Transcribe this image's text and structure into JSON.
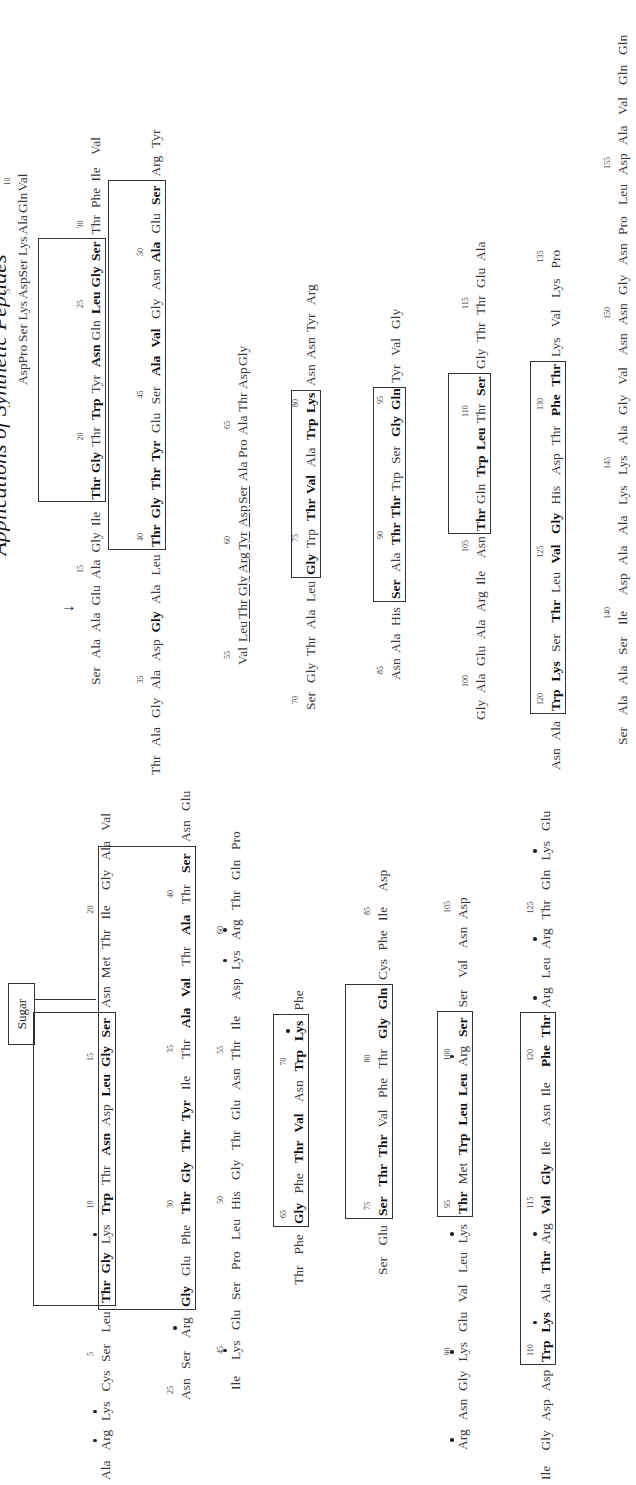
{
  "header": {
    "title": "Applications of Synthetic Peptides"
  },
  "figure": {
    "sugar_label": "Sugar",
    "cleavage_arrow": "↓",
    "sequence_a": {
      "rows": [
        {
          "residues": [
            "Asp",
            "Pro",
            "Ser",
            "Lys",
            "Asp",
            "Ser",
            "Lys",
            "Ala",
            "Gln",
            "Val"
          ],
          "numbers": {
            "4": "5",
            "9": "10"
          }
        },
        {
          "residues": [
            "Ser",
            "Ala",
            "Ala",
            "Glu",
            "Ala",
            "Gly",
            "Ile",
            "Thr",
            "Gly",
            "Thr",
            "Trp",
            "Tyr",
            "Asn",
            "Gln",
            "Leu",
            "Gly",
            "Ser",
            "Thr",
            "Phe",
            "Ile",
            "Val"
          ],
          "bold": [
            7,
            8,
            10,
            12,
            14,
            15,
            16
          ],
          "numbers": {
            "4": "15",
            "9": "20",
            "14": "25",
            "17": "30"
          },
          "box": [
            7,
            16
          ],
          "arrow_after": 2
        },
        {
          "residues": [
            "Thr",
            "Ala",
            "Gly",
            "Ala",
            "Asp",
            "Gly",
            "Ala",
            "Leu",
            "Thr",
            "Gly",
            "Thr",
            "Tyr",
            "Glu",
            "Ser",
            "Ala",
            "Val",
            "Gly",
            "Asn",
            "Ala",
            "Glu",
            "Ser",
            "Arg",
            "Tyr"
          ],
          "bold": [
            5,
            8,
            9,
            10,
            11,
            14,
            15,
            18,
            20
          ],
          "numbers": {
            "3": "35",
            "8": "40",
            "13": "45",
            "18": "50"
          },
          "box": [
            8,
            20
          ]
        },
        {
          "residues": [
            "Val",
            "Leu",
            "Thr",
            "Gly",
            "Arg",
            "Tyr",
            "Asp",
            "Ser",
            "Ala",
            "Pro",
            "Ala",
            "Thr",
            "Asp",
            "Gly"
          ],
          "underline": [
            1,
            2,
            3,
            4,
            5,
            6,
            7
          ],
          "numbers": {
            "0": "55",
            "5": "60",
            "10": "65"
          }
        },
        {
          "residues": [
            "Ser",
            "Gly",
            "Thr",
            "Ala",
            "Leu",
            "Gly",
            "Trp",
            "Thr",
            "Val",
            "Ala",
            "Trp",
            "Lys",
            "Asn",
            "Asn",
            "Tyr",
            "Arg"
          ],
          "bold": [
            5,
            7,
            8,
            10,
            11
          ],
          "subdot": [
            4
          ],
          "numbers": {
            "0": "70",
            "6": "75",
            "11": "80"
          },
          "box": [
            5,
            11
          ]
        },
        {
          "residues": [
            "Asn",
            "Ala",
            "His",
            "Ser",
            "Ala",
            "Thr",
            "Thr",
            "Trp",
            "Ser",
            "Gly",
            "Gln",
            "Tyr",
            "Val",
            "Gly"
          ],
          "bold": [
            3,
            5,
            6,
            9,
            10
          ],
          "numbers": {
            "0": "85",
            "5": "90",
            "10": "95"
          },
          "box": [
            3,
            10
          ]
        },
        {
          "residues": [
            "Gly",
            "Ala",
            "Glu",
            "Ala",
            "Arg",
            "Ile",
            "Asn",
            "Thr",
            "Gln",
            "Trp",
            "Leu",
            "Thr",
            "Ser",
            "Gly",
            "Thr",
            "Thr",
            "Glu",
            "Ala"
          ],
          "bold": [
            7,
            9,
            10,
            12
          ],
          "numbers": {
            "1": "100",
            "6": "105",
            "11": "110",
            "15": "115"
          },
          "box": [
            7,
            12
          ]
        },
        {
          "residues": [
            "Asn",
            "Ala",
            "Trp",
            "Lys",
            "Ser",
            "Thr",
            "Leu",
            "Val",
            "Gly",
            "His",
            "Asp",
            "Thr",
            "Phe",
            "Thr",
            "Lys",
            "Val",
            "Lys",
            "Pro"
          ],
          "bold": [
            2,
            3,
            5,
            7,
            8,
            12,
            13
          ],
          "numbers": {
            "2": "120",
            "7": "125",
            "12": "130",
            "17": "135"
          },
          "box": [
            2,
            13
          ]
        },
        {
          "residues": [
            "Ser",
            "Ala",
            "Ala",
            "Ser",
            "Ile",
            "Asp",
            "Ala",
            "Ala",
            "Lys",
            "Lys",
            "Ala",
            "Gly",
            "Val",
            "Asn",
            "Asn",
            "Gly",
            "Asn",
            "Pro",
            "Leu",
            "Asp",
            "Ala",
            "Val",
            "Gln",
            "Gln"
          ],
          "numbers": {
            "4": "140",
            "9": "145",
            "14": "150",
            "19": "155"
          }
        }
      ]
    },
    "sequence_b": {
      "rows": [
        {
          "residues": [
            "Ala",
            "Arg",
            "Lys",
            "Cys",
            "Ser",
            "Leu",
            "Thr",
            "Gly",
            "Lys",
            "Trp",
            "Thr",
            "Asn",
            "Asp",
            "Leu",
            "Gly",
            "Ser",
            "Asn",
            "Met",
            "Thr",
            "Ile",
            "Gly",
            "Ala",
            "Val"
          ],
          "bold": [
            6,
            7,
            9,
            11,
            13,
            14,
            15
          ],
          "dot": [
            1,
            2,
            8
          ],
          "numbers": {
            "4": "5",
            "9": "10",
            "14": "15",
            "19": "20"
          },
          "box": [
            6,
            15
          ],
          "sugar_on": 16
        },
        {
          "residues": [
            "Asn",
            "Ser",
            "Arg",
            "Gly",
            "Glu",
            "Phe",
            "Thr",
            "Gly",
            "Thr",
            "Tyr",
            "Ile",
            "Thr",
            "Ala",
            "Val",
            "Thr",
            "Ala",
            "Thr",
            "Ser",
            "Asn",
            "Glu"
          ],
          "bold": [
            3,
            6,
            7,
            8,
            9,
            12,
            13,
            15,
            17
          ],
          "dot": [
            2
          ],
          "numbers": {
            "0": "25",
            "6": "30",
            "11": "35",
            "16": "40"
          },
          "box": [
            3,
            17
          ]
        },
        {
          "residues": [
            "Ile",
            "Lys",
            "Glu",
            "Ser",
            "Pro",
            "Leu",
            "His",
            "Gly",
            "Thr",
            "Glu",
            "Asn",
            "Thr",
            "Ile",
            "Asp",
            "Lys",
            "Arg",
            "Thr",
            "Gln",
            "Pro"
          ],
          "dot": [
            1,
            14,
            15
          ],
          "numbers": {
            "1": "45",
            "6": "50",
            "11": "55",
            "15": "60"
          }
        },
        {
          "residues": [
            "Thr",
            "Phe",
            "Gly",
            "Phe",
            "Thr",
            "Val",
            "Asn",
            "Trp",
            "Lys",
            "Phe"
          ],
          "bold": [
            2,
            4,
            5,
            7,
            8
          ],
          "dot": [
            8
          ],
          "numbers": {
            "2": "65",
            "7": "70"
          },
          "box": [
            2,
            8
          ]
        },
        {
          "residues": [
            "Ser",
            "Glu",
            "Ser",
            "Thr",
            "Thr",
            "Val",
            "Phe",
            "Thr",
            "Gly",
            "Gln",
            "Cys",
            "Phe",
            "Ile",
            "Asp"
          ],
          "bold": [
            2,
            3,
            4,
            8,
            9
          ],
          "numbers": {
            "2": "75",
            "7": "80",
            "12": "85"
          },
          "box": [
            2,
            9
          ]
        },
        {
          "residues": [
            "Arg",
            "Asn",
            "Gly",
            "Lys",
            "Glu",
            "Val",
            "Leu",
            "Lys",
            "Thr",
            "Met",
            "Trp",
            "Leu",
            "Leu",
            "Arg",
            "Ser",
            "Ser",
            "Val",
            "Asn",
            "Asp"
          ],
          "bold": [
            8,
            10,
            11,
            12,
            14
          ],
          "dot": [
            0,
            3,
            7,
            13
          ],
          "numbers": {
            "3": "90",
            "8": "95",
            "13": "100",
            "18": "105"
          },
          "box": [
            8,
            14
          ]
        },
        {
          "residues": [
            "Ile",
            "Gly",
            "Asp",
            "Asp",
            "Trp",
            "Lys",
            "Ala",
            "Thr",
            "Arg",
            "Val",
            "Gly",
            "Ile",
            "Asn",
            "Ile",
            "Phe",
            "Thr",
            "Arg",
            "Leu",
            "Arg",
            "Thr",
            "Gln",
            "Lys",
            "Glu"
          ],
          "bold": [
            4,
            5,
            7,
            9,
            10,
            14,
            15
          ],
          "dot": [
            5,
            8,
            16,
            18,
            21
          ],
          "numbers": {
            "4": "110",
            "9": "115",
            "14": "120",
            "19": "125"
          },
          "box": [
            4,
            15
          ]
        }
      ]
    }
  }
}
